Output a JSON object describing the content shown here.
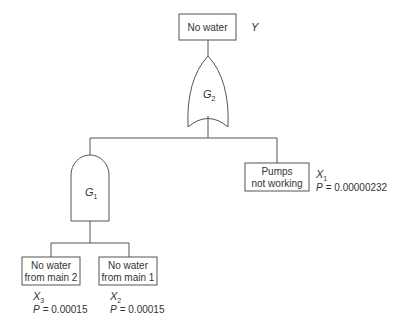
{
  "diagram": {
    "type": "fault-tree",
    "top_event": {
      "label": "No water",
      "symbol": "Y"
    },
    "gates": [
      {
        "id": "G2",
        "name": "G",
        "sub": "2",
        "kind": "OR"
      },
      {
        "id": "G1",
        "name": "G",
        "sub": "1",
        "kind": "AND"
      }
    ],
    "events": [
      {
        "id": "X1",
        "line1": "Pumps",
        "line2": "not working",
        "symbol": "X",
        "sub": "1",
        "p_label": "P",
        "p_value": "= 0.00000232"
      },
      {
        "id": "X3",
        "line1": "No water",
        "line2": "from main 2",
        "symbol": "X",
        "sub": "3",
        "p_label": "P",
        "p_value": "= 0.00015"
      },
      {
        "id": "X2",
        "line1": "No water",
        "line2": "from main 1",
        "symbol": "X",
        "sub": "2",
        "p_label": "P",
        "p_value": "= 0.00015"
      }
    ]
  }
}
